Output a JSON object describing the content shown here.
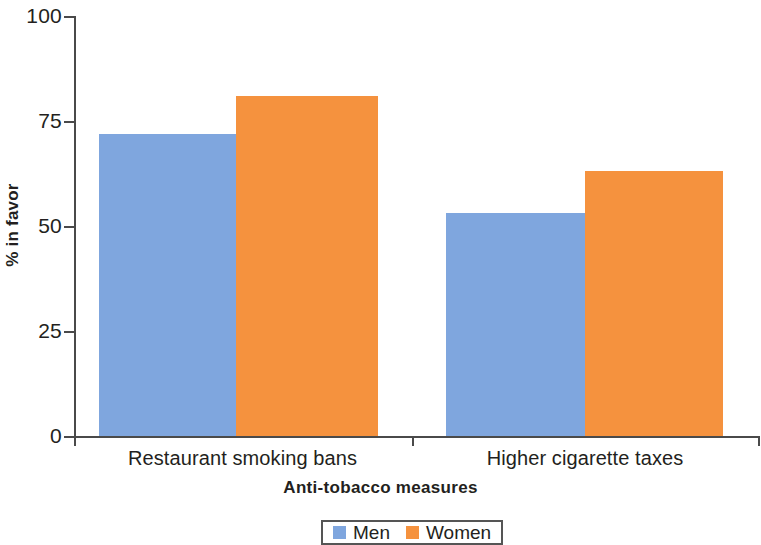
{
  "chart_data": {
    "type": "bar",
    "title": "",
    "xlabel": "Anti-tobacco measures",
    "ylabel": "% in favor",
    "categories": [
      "Restaurant smoking bans",
      "Higher cigarette taxes"
    ],
    "series": [
      {
        "name": "Men",
        "color": "#7fa6de",
        "values": [
          72,
          53
        ]
      },
      {
        "name": "Women",
        "color": "#f5923e",
        "values": [
          81,
          63
        ]
      }
    ],
    "ylim": [
      0,
      100
    ],
    "yticks": [
      0,
      25,
      50,
      75,
      100
    ],
    "ytick_labels": [
      "0",
      "25",
      "50",
      "75",
      "100"
    ],
    "grid": false,
    "legend_position": "bottom-center",
    "legend_entries": [
      "Men",
      "Women"
    ]
  },
  "axes": {
    "y_tick_labels": [
      "100",
      "75",
      "50",
      "25",
      "0"
    ],
    "y_axis_title": "% in favor",
    "x_axis_title": "Anti-tobacco measures",
    "x_group_labels": [
      "Restaurant smoking bans",
      "Higher cigarette taxes"
    ]
  },
  "legend": {
    "items": [
      {
        "label": "Men",
        "color": "#7fa6de"
      },
      {
        "label": "Women",
        "color": "#f5923e"
      }
    ]
  },
  "colors": {
    "men": "#7fa6de",
    "women": "#f5923e",
    "axis": "#4a4a4a",
    "text": "#231f20",
    "background": "#ffffff"
  }
}
